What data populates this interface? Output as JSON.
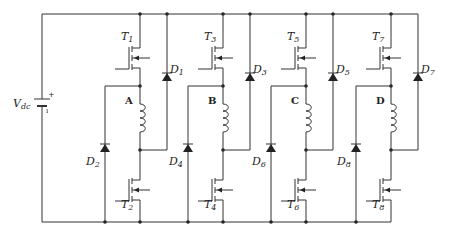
{
  "source": {
    "label": "V",
    "subscript": "dc",
    "plus": "+",
    "minus": "−"
  },
  "phases": [
    {
      "name": "A",
      "upper_switch": "T",
      "upper_sub": "1",
      "lower_switch": "T",
      "lower_sub": "2",
      "upper_diode": "D",
      "upper_diode_sub": "1",
      "lower_diode": "D",
      "lower_diode_sub": "2"
    },
    {
      "name": "B",
      "upper_switch": "T",
      "upper_sub": "3",
      "lower_switch": "T",
      "lower_sub": "4",
      "upper_diode": "D",
      "upper_diode_sub": "3",
      "lower_diode": "D",
      "lower_diode_sub": "4"
    },
    {
      "name": "C",
      "upper_switch": "T",
      "upper_sub": "5",
      "lower_switch": "T",
      "lower_sub": "6",
      "upper_diode": "D",
      "upper_diode_sub": "5",
      "lower_diode": "D",
      "lower_diode_sub": "6"
    },
    {
      "name": "D",
      "upper_switch": "T",
      "upper_sub": "7",
      "lower_switch": "T",
      "lower_sub": "8",
      "upper_diode": "D",
      "upper_diode_sub": "7",
      "lower_diode": "D",
      "lower_diode_sub": "8"
    }
  ],
  "colors": {
    "wire": "#333333",
    "background": "#ffffff"
  }
}
